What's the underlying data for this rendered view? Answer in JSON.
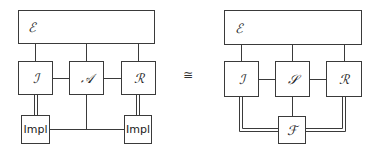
{
  "left_diagram": {
    "environment": {
      "label": "ℰ"
    },
    "nodes": [
      {
        "id": "I",
        "label": "ℐ"
      },
      {
        "id": "A",
        "label": "𝒜"
      },
      {
        "id": "R",
        "label": "ℛ"
      }
    ],
    "impl_left": {
      "label": "Impl"
    },
    "impl_right": {
      "label": "Impl"
    }
  },
  "relation": {
    "symbol": "≅"
  },
  "right_diagram": {
    "environment": {
      "label": "ℰ"
    },
    "nodes": [
      {
        "id": "I",
        "label": "ℐ"
      },
      {
        "id": "S",
        "label": "𝒮"
      },
      {
        "id": "R",
        "label": "ℛ"
      }
    ],
    "functionality": {
      "label": "ℱ"
    }
  },
  "colors": {
    "line": "#3a3a3a",
    "background": "#ffffff"
  }
}
